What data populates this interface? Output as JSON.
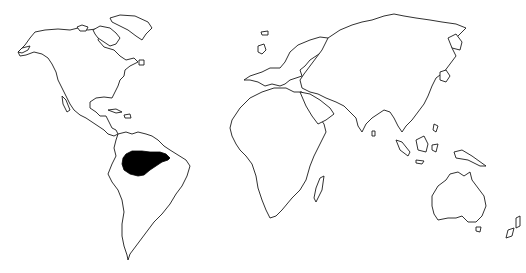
{
  "map": {
    "type": "world-outline-distribution-map",
    "projection": "simple world outline",
    "background_color": "#ffffff",
    "outline_color": "#1a1a1a",
    "highlight_color": "#000000",
    "highlighted_regions": [
      {
        "name": "Amazon basin (northern South America)",
        "color": "#000000"
      }
    ],
    "continents": [
      "North America",
      "Greenland",
      "South America",
      "Europe",
      "Africa",
      "Asia",
      "Australia",
      "New Zealand"
    ]
  }
}
